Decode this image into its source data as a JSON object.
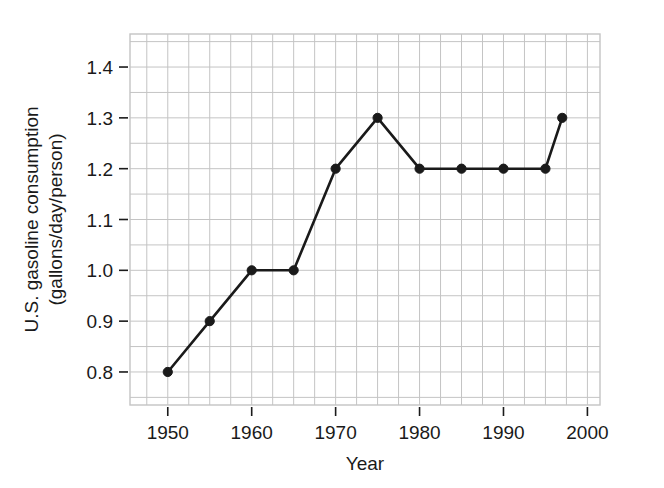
{
  "chart_data": {
    "type": "line",
    "title": "",
    "subtitle": "",
    "xlabel": "Year",
    "ylabel": "U.S. gasoline consumption (gallons/day/person)",
    "ylabel_lines": [
      "U.S. gasoline consumption",
      "(gallons/day/person)"
    ],
    "x": [
      1950,
      1955,
      1960,
      1965,
      1970,
      1975,
      1980,
      1985,
      1990,
      1995,
      1997
    ],
    "values": [
      0.8,
      0.9,
      1.0,
      1.0,
      1.2,
      1.3,
      1.2,
      1.2,
      1.2,
      1.2,
      1.3
    ],
    "series": [
      {
        "name": "U.S. gasoline consumption",
        "x": [
          1950,
          1955,
          1960,
          1965,
          1970,
          1975,
          1980,
          1985,
          1990,
          1995,
          1997
        ],
        "values": [
          0.8,
          0.9,
          1.0,
          1.0,
          1.2,
          1.3,
          1.2,
          1.2,
          1.2,
          1.2,
          1.3
        ],
        "color": "#1a1a1a",
        "marker": "filled-circle"
      }
    ],
    "xlim": [
      1945.5,
      2001.5
    ],
    "ylim": [
      0.735,
      1.465
    ],
    "xticks": [
      1950,
      1960,
      1970,
      1980,
      1990,
      2000
    ],
    "xtick_labels": [
      "1950",
      "1960",
      "1970",
      "1980",
      "1990",
      "2000"
    ],
    "yticks": [
      0.8,
      0.9,
      1.0,
      1.1,
      1.2,
      1.3,
      1.4
    ],
    "ytick_labels": [
      "0.8",
      "0.9",
      "1.0",
      "1.1",
      "1.2",
      "1.3",
      "1.4"
    ],
    "x_minor_step": 2.5,
    "y_minor_step": 0.05,
    "grid": true,
    "grid_color": "#c4c4c4",
    "legend": false,
    "legend_position": "none",
    "background_color": "#ffffff",
    "line_color": "#1a1a1a",
    "annotations": []
  }
}
